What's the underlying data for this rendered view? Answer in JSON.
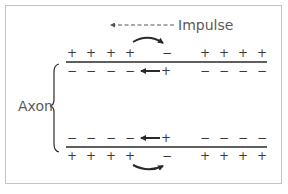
{
  "diagram": {
    "title_label": "Impulse",
    "side_label": "Axon",
    "impulse_direction": "left",
    "colors": {
      "frame": "#c4c4c4",
      "membrane": "#2a2a2a",
      "text": "#5a5a5a",
      "signs": "#3a3a3a"
    },
    "top_membrane": {
      "outside_signs": [
        "+",
        "+",
        "+",
        "+",
        "−",
        "+",
        "+",
        "+",
        "+"
      ],
      "inside_signs": [
        "−",
        "−",
        "−",
        "−",
        "+",
        "−",
        "−",
        "−",
        "−"
      ],
      "curved_arrow": "outside, from + toward −, pointing right",
      "straight_arrow": "inside, from + toward −, pointing left"
    },
    "bottom_membrane": {
      "inside_signs": [
        "−",
        "−",
        "−",
        "−",
        "+",
        "−",
        "−",
        "−",
        "−"
      ],
      "outside_signs": [
        "+",
        "+",
        "+",
        "+",
        "−",
        "+",
        "+",
        "+",
        "+"
      ],
      "curved_arrow": "outside, from + toward −, pointing right",
      "straight_arrow": "inside, from + toward −, pointing left"
    }
  }
}
